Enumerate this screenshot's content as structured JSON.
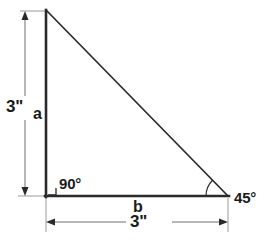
{
  "diagram": {
    "type": "right-triangle-geometry",
    "shape_name": "right triangle",
    "colors": {
      "background": "#ffffff",
      "triangle_stroke": "#2a2a2a",
      "dimension_line": "#808080",
      "extension_line": "#9a9a9a",
      "text": "#1a1a1a"
    },
    "vertices": {
      "top_left": [
        46,
        11
      ],
      "bottom_left": [
        46,
        196
      ],
      "bottom_right": [
        228,
        196
      ]
    },
    "labels": {
      "vertical_dimension": "3\"",
      "side_a": "a",
      "right_angle": "90°",
      "side_b": "b",
      "horizontal_dimension": "3\"",
      "angle_45": "45°"
    },
    "measurements": [
      {
        "name": "leg-a-length",
        "value": "3\"",
        "orientation": "vertical"
      },
      {
        "name": "leg-b-length",
        "value": "3\"",
        "orientation": "horizontal"
      }
    ],
    "angles": [
      {
        "name": "right-angle",
        "value": "90°",
        "at": "bottom_left",
        "marker": "square"
      },
      {
        "name": "acute-angle",
        "value": "45°",
        "at": "bottom_right",
        "marker": "arc"
      }
    ]
  }
}
